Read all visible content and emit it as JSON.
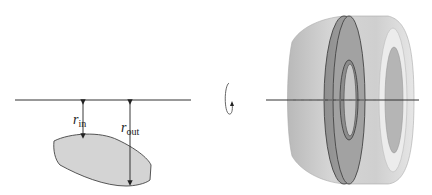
{
  "diagram": {
    "type": "solid-of-revolution-washer",
    "left_panel": {
      "axis": {
        "y": 100,
        "x1": 15,
        "x2": 191
      },
      "region_fill": "#d4d4d4",
      "labels": {
        "r_in": {
          "main": "r",
          "sub": "in"
        },
        "r_out": {
          "main": "r",
          "sub": "out"
        }
      }
    },
    "rotation_icon": "rotate-about-axis-icon",
    "right_panel": {
      "axis": {
        "y": 100,
        "x1": 266,
        "x2": 419
      },
      "solid_fill": "#c8c8c8",
      "washer_fill": "#9a9a9a"
    }
  }
}
